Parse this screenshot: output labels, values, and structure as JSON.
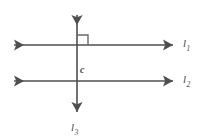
{
  "figure": {
    "type": "geometry-diagram",
    "canvas": {
      "width": 201,
      "height": 138,
      "background": "#ffffff"
    },
    "stroke_color": "#4f4f4f",
    "label_color": "#484848",
    "labels": {
      "line1": {
        "text": "l",
        "subscript": "1"
      },
      "line2": {
        "text": "l",
        "subscript": "2"
      },
      "line3": {
        "text": "l",
        "subscript": "3"
      },
      "intersection_point": {
        "text": "c"
      }
    },
    "geometry": {
      "line1": {
        "name": "l1",
        "orientation": "horizontal",
        "y": 45,
        "x_start": 9,
        "x_end": 178,
        "arrows": "both"
      },
      "line2": {
        "name": "l2",
        "orientation": "horizontal",
        "y": 81,
        "x_start": 9,
        "x_end": 178,
        "arrows": "both"
      },
      "line3": {
        "name": "l3",
        "orientation": "vertical",
        "x": 77,
        "y_start": 10,
        "y_end": 117,
        "arrows": "both"
      },
      "right_angle_marker": {
        "at": "l1-l3 intersection",
        "quadrant": "upper-right",
        "size": 10
      },
      "point_c": {
        "at": "l2-l3 intersection",
        "x": 77,
        "y": 81
      }
    }
  }
}
